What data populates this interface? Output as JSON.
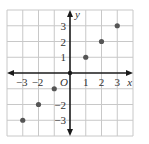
{
  "chart_data": {
    "type": "scatter",
    "title": "",
    "xlabel": "x",
    "ylabel": "y",
    "origin_label": "O",
    "xlim": [
      -4,
      4
    ],
    "ylim": [
      -4,
      4
    ],
    "grid": true,
    "x_ticks": [
      -3,
      -2,
      1,
      2,
      3
    ],
    "y_ticks": [
      3,
      2,
      1,
      -2,
      -3
    ],
    "x_tick_labels": [
      "−3",
      "−2",
      "1",
      "2",
      "3"
    ],
    "y_tick_labels": [
      "3",
      "2",
      "1",
      "−2",
      "−3"
    ],
    "points": [
      {
        "x": -3,
        "y": -3
      },
      {
        "x": -2,
        "y": -2
      },
      {
        "x": -1,
        "y": -1
      },
      {
        "x": 0,
        "y": 0
      },
      {
        "x": 1,
        "y": 1
      },
      {
        "x": 2,
        "y": 2
      },
      {
        "x": 3,
        "y": 3
      }
    ],
    "colors": {
      "grid": "#c8c8c8",
      "axis": "#1a1a1a",
      "point": "#555555"
    }
  }
}
